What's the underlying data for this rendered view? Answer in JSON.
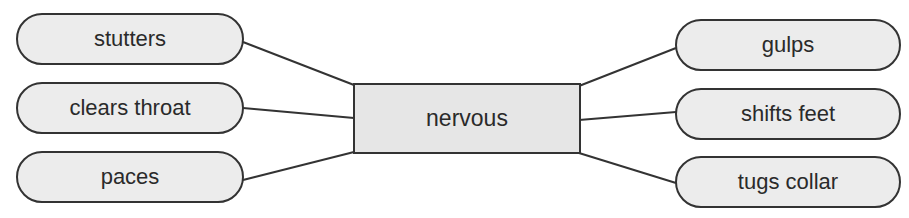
{
  "diagram": {
    "type": "word-web",
    "center": {
      "label": "nervous"
    },
    "left_nodes": [
      {
        "label": "stutters"
      },
      {
        "label": "clears throat"
      },
      {
        "label": "paces"
      }
    ],
    "right_nodes": [
      {
        "label": "gulps"
      },
      {
        "label": "shifts feet"
      },
      {
        "label": "tugs collar"
      }
    ],
    "colors": {
      "node_fill": "#ececec",
      "center_fill": "#e6e6e6",
      "stroke": "#333333",
      "text": "#2a2a2a"
    }
  }
}
